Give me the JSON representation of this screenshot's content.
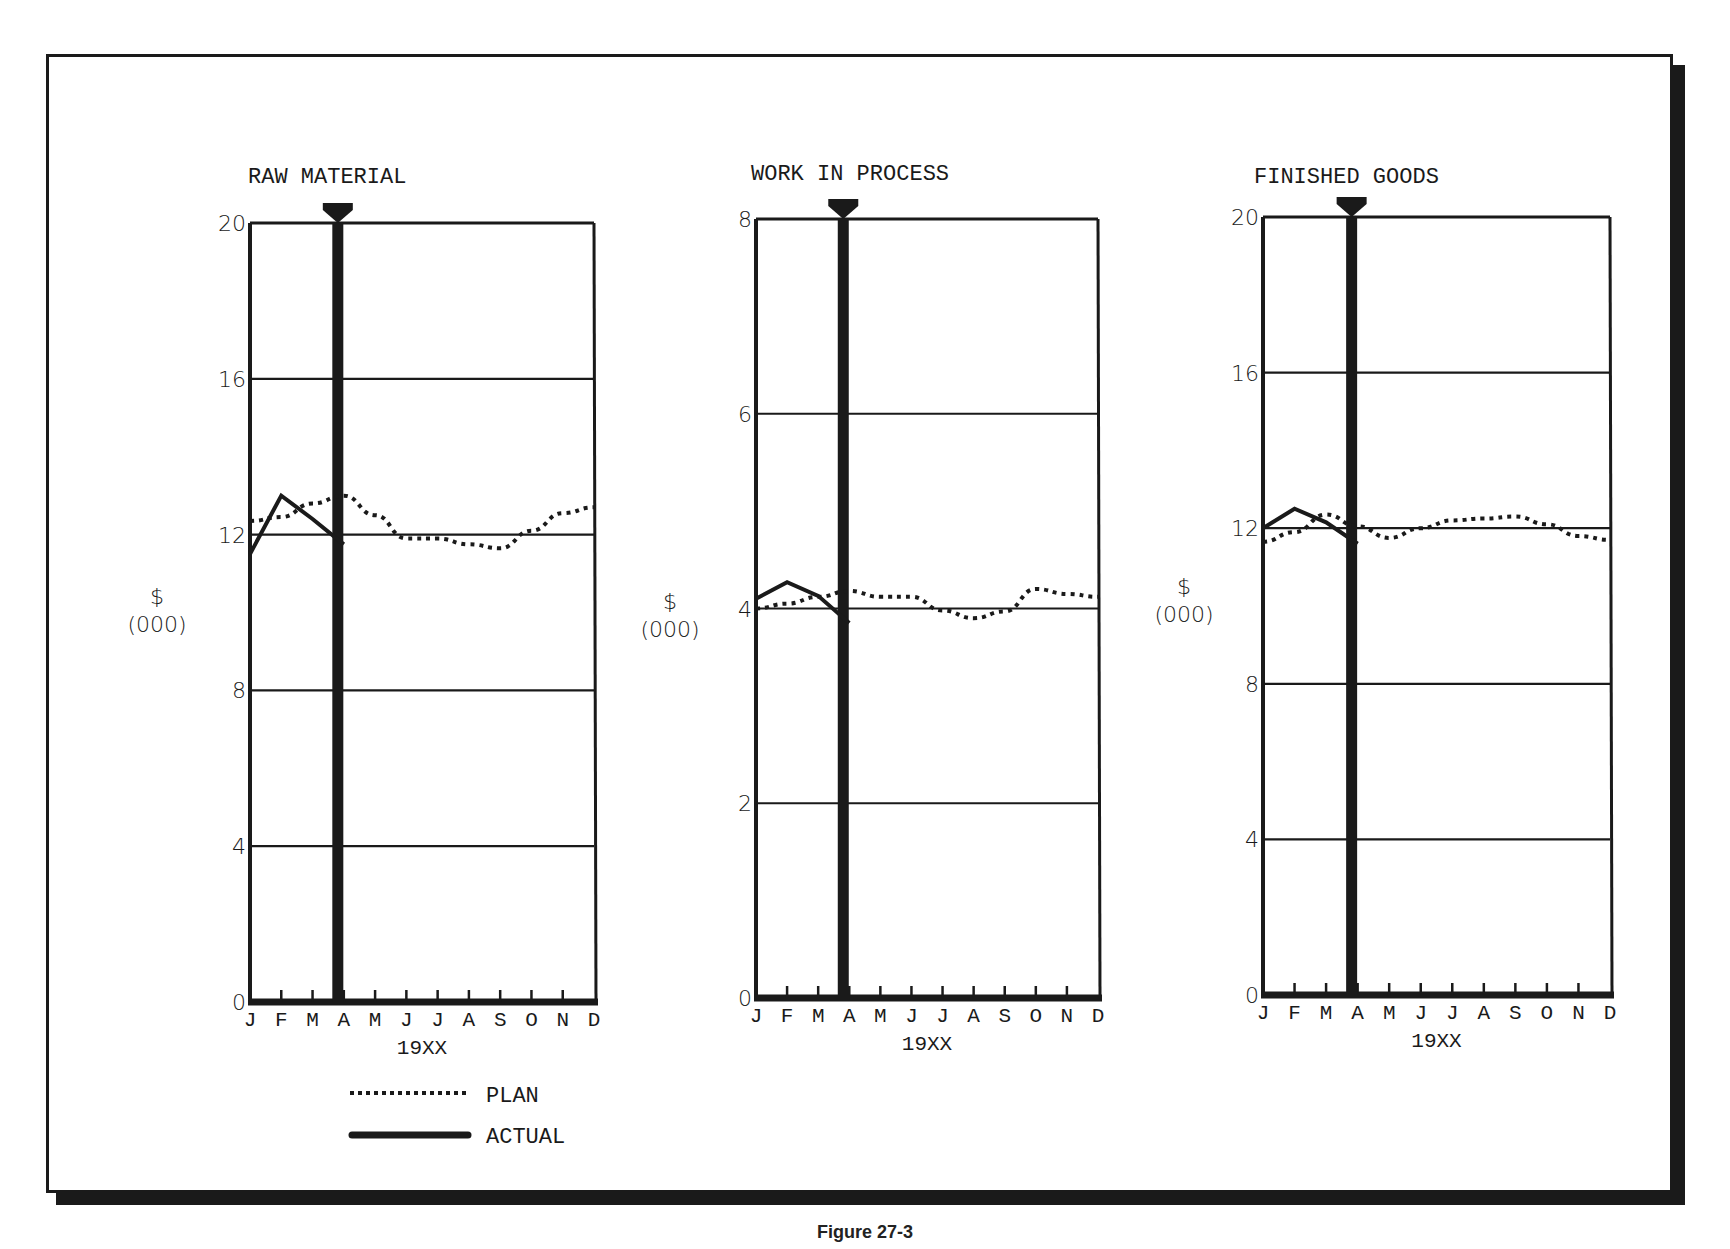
{
  "figure": {
    "legend": {
      "plan_label": "PLAN",
      "actual_label": "ACTUAL"
    },
    "caption": "Figure 27-3"
  },
  "chart_data": [
    {
      "type": "line",
      "title": "RAW MATERIAL",
      "xlabel": "19XX",
      "ylabel": "$ (000)",
      "categories": [
        "J",
        "F",
        "M",
        "A",
        "M",
        "J",
        "J",
        "A",
        "S",
        "O",
        "N",
        "D"
      ],
      "yticks": [
        0,
        4,
        8,
        12,
        16,
        20
      ],
      "ylim": [
        0,
        20
      ],
      "grid": true,
      "current_month_marker": "A",
      "series": [
        {
          "name": "PLAN",
          "style": "dotted",
          "values": [
            12.35,
            12.45,
            12.8,
            13.0,
            12.5,
            11.9,
            11.9,
            11.75,
            11.65,
            12.1,
            12.55,
            12.7
          ]
        },
        {
          "name": "ACTUAL",
          "style": "solid",
          "values": [
            11.5,
            13.0,
            12.4,
            11.75,
            null,
            null,
            null,
            null,
            null,
            null,
            null,
            null
          ]
        }
      ]
    },
    {
      "type": "line",
      "title": "WORK IN PROCESS",
      "xlabel": "19XX",
      "ylabel": "$ (000)",
      "categories": [
        "J",
        "F",
        "M",
        "A",
        "M",
        "J",
        "J",
        "A",
        "S",
        "O",
        "N",
        "D"
      ],
      "yticks": [
        0,
        2,
        4,
        6,
        8
      ],
      "ylim": [
        0,
        8
      ],
      "grid": true,
      "current_month_marker": "A",
      "series": [
        {
          "name": "PLAN",
          "style": "dotted",
          "values": [
            4.0,
            4.05,
            4.12,
            4.18,
            4.12,
            4.12,
            3.98,
            3.9,
            3.97,
            4.2,
            4.15,
            4.12
          ]
        },
        {
          "name": "ACTUAL",
          "style": "solid",
          "values": [
            4.1,
            4.27,
            4.13,
            3.85,
            null,
            null,
            null,
            null,
            null,
            null,
            null,
            null
          ]
        }
      ]
    },
    {
      "type": "line",
      "title": "FINISHED GOODS",
      "xlabel": "19XX",
      "ylabel": "$ (000)",
      "categories": [
        "J",
        "F",
        "M",
        "A",
        "M",
        "J",
        "J",
        "A",
        "S",
        "O",
        "N",
        "D"
      ],
      "yticks": [
        0,
        4,
        8,
        12,
        16,
        20
      ],
      "ylim": [
        0,
        20
      ],
      "grid": true,
      "current_month_marker": "A",
      "series": [
        {
          "name": "PLAN",
          "style": "dotted",
          "values": [
            11.65,
            11.9,
            12.35,
            12.05,
            11.75,
            12.0,
            12.2,
            12.25,
            12.3,
            12.1,
            11.8,
            11.7
          ]
        },
        {
          "name": "ACTUAL",
          "style": "solid",
          "values": [
            12.0,
            12.5,
            12.15,
            11.6,
            null,
            null,
            null,
            null,
            null,
            null,
            null,
            null
          ]
        }
      ]
    }
  ],
  "layout": {
    "panels": [
      {
        "left": 250,
        "right": 594,
        "top": 223,
        "bottom": 1002,
        "title_x": 248,
        "title_y": 183,
        "ylab_x": 157,
        "ylab_y1": 604,
        "ylab_y2": 632
      },
      {
        "left": 756,
        "right": 1098,
        "top": 219,
        "bottom": 998,
        "title_x": 751,
        "title_y": 180,
        "ylab_x": 670,
        "ylab_y1": 609,
        "ylab_y2": 637
      },
      {
        "left": 1263,
        "right": 1610,
        "top": 217,
        "bottom": 995,
        "title_x": 1254,
        "title_y": 183,
        "ylab_x": 1184,
        "ylab_y1": 594,
        "ylab_y2": 622
      }
    ]
  }
}
